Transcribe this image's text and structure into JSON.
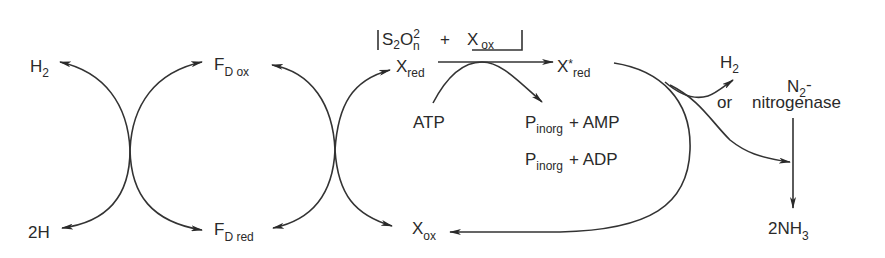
{
  "diagram": {
    "type": "biochemical-electron-transfer-pathway",
    "left_cycle": {
      "top_label": {
        "main": "H",
        "sub": "2"
      },
      "bottom_label": {
        "main": "2H",
        "sub": ""
      }
    },
    "ferredoxin": {
      "oxidized": {
        "main": "F",
        "sub": "D ox"
      },
      "reduced": {
        "main": "F",
        "sub": "D red"
      }
    },
    "boxed_reactants": {
      "s2o": {
        "main": "S",
        "sub1": "2",
        "o": "O",
        "sup": "2",
        "subn": "n"
      },
      "plus": "+",
      "x_ox": {
        "main": "X",
        "sub": "ox"
      }
    },
    "carrier": {
      "reduced": {
        "main": "X",
        "sub": "red"
      },
      "activated": {
        "main": "X",
        "star": "*",
        "sub": "red"
      },
      "oxidized": {
        "main": "X",
        "sub": "ox"
      }
    },
    "energy": {
      "atp": "ATP",
      "product_1": {
        "p": "P",
        "sub": "inorg",
        "rest": "+  AMP"
      },
      "product_2": {
        "p": "P",
        "sub": "inorg",
        "rest": "+  ADP"
      }
    },
    "outputs": {
      "h2": {
        "main": "H",
        "sub": "2"
      },
      "or": "or",
      "n2": {
        "main": "N",
        "sub": "2",
        "suffix": "-"
      },
      "enzyme": "nitrogenase",
      "product": {
        "pre": "2NH",
        "sub": "3"
      }
    },
    "colors": {
      "ink": "#2a2a2a",
      "background": "#ffffff"
    }
  }
}
